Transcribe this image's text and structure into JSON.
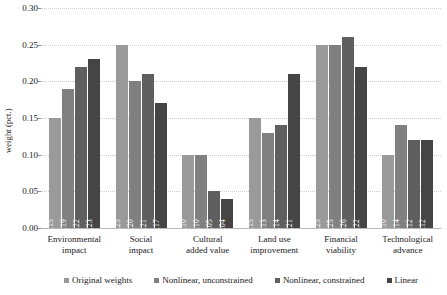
{
  "chart_data": {
    "type": "bar",
    "title": "",
    "subtitle": "",
    "xlabel": "",
    "ylabel": "weight (pct.)",
    "ylim": [
      0.0,
      0.3
    ],
    "ytick_labels": [
      "0.30",
      "0.25",
      "0.20",
      "0.15",
      "0.10",
      "0.05",
      "0.00"
    ],
    "ytick_values": [
      0.3,
      0.25,
      0.2,
      0.15,
      0.1,
      0.05,
      0.0
    ],
    "grid": true,
    "legend_position": "bottom",
    "bar_label_format": "0.00",
    "categories": [
      "Environmental impact",
      "Social impact",
      "Cultural added value",
      "Land use improvement",
      "Financial viability",
      "Technological advance"
    ],
    "category_lines": [
      [
        "Environmental",
        "impact"
      ],
      [
        "Social",
        "impact"
      ],
      [
        "Cultural",
        "added value"
      ],
      [
        "Land use",
        "improvement"
      ],
      [
        "Financial",
        "viability"
      ],
      [
        "Technological",
        "advance"
      ]
    ],
    "series": [
      {
        "name": "Original weights",
        "color": "#9a9a9a",
        "values": [
          0.15,
          0.25,
          0.1,
          0.15,
          0.25,
          0.1
        ],
        "labels": [
          "0.15",
          "0.25",
          "0.10",
          "0.15",
          "0.25",
          "0.10"
        ]
      },
      {
        "name": "Nonlinear, unconstrained",
        "color": "#808080",
        "values": [
          0.19,
          0.2,
          0.1,
          0.13,
          0.25,
          0.14
        ],
        "labels": [
          "0.19",
          "0.20",
          "0.10",
          "0.13",
          "0.25",
          "0.14"
        ]
      },
      {
        "name": "Nonlinear, constrained",
        "color": "#5f5f5f",
        "values": [
          0.22,
          0.21,
          0.05,
          0.14,
          0.26,
          0.12
        ],
        "labels": [
          "0.22",
          "0.21",
          "0.05",
          "0.14",
          "0.26",
          "0.12"
        ]
      },
      {
        "name": "Linear",
        "color": "#454545",
        "values": [
          0.23,
          0.17,
          0.04,
          0.21,
          0.22,
          0.12
        ],
        "labels": [
          "0.23",
          "0.17",
          "0.04",
          "0.21",
          "0.22",
          "0.12"
        ]
      }
    ]
  },
  "legend": {
    "items": [
      {
        "label": "Original weights"
      },
      {
        "label": "Nonlinear, unconstrained"
      },
      {
        "label": "Nonlinear, constrained"
      },
      {
        "label": "Linear"
      }
    ]
  },
  "colors": {
    "series_0": "#9a9a9a",
    "series_1": "#808080",
    "series_2": "#5f5f5f",
    "series_3": "#454545",
    "gridline": "#cfcfcf",
    "axis": "#b8b8b8",
    "text": "#1a1a1a",
    "background": "#ffffff"
  }
}
